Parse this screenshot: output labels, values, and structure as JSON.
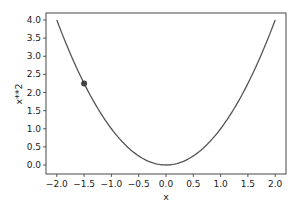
{
  "chart_data": {
    "type": "line",
    "title": "",
    "xlabel": "x",
    "ylabel": "x**2",
    "xlim": [
      -2.2,
      2.2
    ],
    "ylim": [
      -0.2,
      4.2
    ],
    "grid": false,
    "legend": null,
    "x_ticks": [
      "−2.0",
      "−1.5",
      "−1.0",
      "−0.5",
      "0.0",
      "0.5",
      "1.0",
      "1.5",
      "2.0"
    ],
    "x_tick_values": [
      -2.0,
      -1.5,
      -1.0,
      -0.5,
      0.0,
      0.5,
      1.0,
      1.5,
      2.0
    ],
    "y_ticks": [
      "0.0",
      "0.5",
      "1.0",
      "1.5",
      "2.0",
      "2.5",
      "3.0",
      "3.5",
      "4.0"
    ],
    "y_tick_values": [
      0.0,
      0.5,
      1.0,
      1.5,
      2.0,
      2.5,
      3.0,
      3.5,
      4.0
    ],
    "series": [
      {
        "name": "x**2",
        "function": "y = x^2",
        "x_range": [
          -2.0,
          2.0
        ],
        "color": "#555555",
        "x": [
          -2.0,
          -1.5,
          -1.0,
          -0.5,
          0.0,
          0.5,
          1.0,
          1.5,
          2.0
        ],
        "y": [
          4.0,
          2.25,
          1.0,
          0.25,
          0.0,
          0.25,
          1.0,
          2.25,
          4.0
        ]
      }
    ],
    "markers": [
      {
        "x": -1.5,
        "y": 2.25,
        "color": "#444444"
      }
    ]
  }
}
